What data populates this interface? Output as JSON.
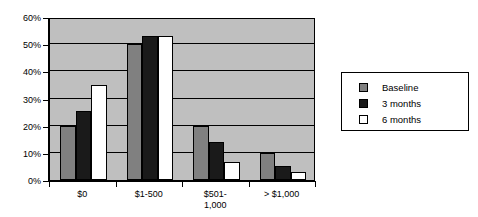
{
  "chart_data": {
    "type": "bar",
    "title": "",
    "subtitle": "",
    "xlabel": "",
    "ylabel": "",
    "categories": [
      "$0",
      "$1-500",
      "$501-\n1,000",
      "> $1,000"
    ],
    "category_labels": [
      {
        "line1": "$0",
        "line2": ""
      },
      {
        "line1": "$1-500",
        "line2": ""
      },
      {
        "line1": "$501-",
        "line2": "1,000"
      },
      {
        "line1": "> $1,000",
        "line2": ""
      }
    ],
    "series": [
      {
        "name": "Baseline",
        "color": "#808080",
        "values": [
          20,
          50,
          20,
          10
        ]
      },
      {
        "name": "3 months",
        "color": "#1a1a1a",
        "values": [
          25.5,
          53,
          14,
          5
        ]
      },
      {
        "name": "6 months",
        "color": "#ffffff",
        "values": [
          35,
          53,
          6.5,
          3
        ]
      }
    ],
    "ylim": [
      0,
      60
    ],
    "ytick_values": [
      0,
      10,
      20,
      30,
      40,
      50,
      60
    ],
    "ytick_labels": [
      "0%",
      "10%",
      "20%",
      "30%",
      "40%",
      "50%",
      "60%"
    ],
    "grid": true,
    "grid_axis": "y",
    "legend_position": "right",
    "plot_background": "#bfbfbf",
    "axis_color": "#000000"
  },
  "legend": {
    "entries": [
      {
        "label": "Baseline",
        "swatch": "gray-swatch"
      },
      {
        "label": "3 months",
        "swatch": "black-swatch"
      },
      {
        "label": "6 months",
        "swatch": "white-swatch"
      }
    ]
  }
}
